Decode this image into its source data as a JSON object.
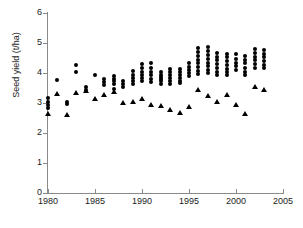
{
  "chart_data": {
    "type": "scatter",
    "title": "",
    "subtitle": "",
    "xlabel": "",
    "ylabel": "Seed yield (t/ha)",
    "xlim": [
      1980,
      2005
    ],
    "ylim": [
      0,
      6
    ],
    "xticks": [
      1980,
      1985,
      1990,
      1995,
      2000,
      2005
    ],
    "yticks": [
      0,
      1,
      2,
      3,
      4,
      5,
      6
    ],
    "xtick_labels": [
      "1980",
      "1985",
      "1990",
      "1995",
      "2000",
      "2005"
    ],
    "ytick_labels": [
      "0",
      "1",
      "2",
      "3",
      "4",
      "5",
      "6"
    ],
    "grid": false,
    "legend": "none",
    "marker_colors": {
      "circle": "#000000",
      "triangle": "#000000"
    },
    "series": [
      {
        "name": "Trial seed yield",
        "marker": "circle",
        "points": [
          [
            1980,
            3.18
          ],
          [
            1980,
            3.05
          ],
          [
            1980,
            2.95
          ],
          [
            1980,
            2.85
          ],
          [
            1981,
            3.77
          ],
          [
            1982,
            3.05
          ],
          [
            1982,
            2.98
          ],
          [
            1983,
            4.27
          ],
          [
            1983,
            4.03
          ],
          [
            1984,
            3.55
          ],
          [
            1984,
            3.45
          ],
          [
            1985,
            3.95
          ],
          [
            1986,
            3.8
          ],
          [
            1986,
            3.7
          ],
          [
            1986,
            3.6
          ],
          [
            1987,
            3.9
          ],
          [
            1987,
            3.8
          ],
          [
            1987,
            3.72
          ],
          [
            1987,
            3.62
          ],
          [
            1987,
            3.48
          ],
          [
            1988,
            3.72
          ],
          [
            1988,
            3.62
          ],
          [
            1988,
            3.55
          ],
          [
            1989,
            4.08
          ],
          [
            1989,
            3.95
          ],
          [
            1989,
            3.85
          ],
          [
            1989,
            3.75
          ],
          [
            1989,
            3.65
          ],
          [
            1990,
            4.3
          ],
          [
            1990,
            4.18
          ],
          [
            1990,
            4.05
          ],
          [
            1990,
            3.95
          ],
          [
            1990,
            3.85
          ],
          [
            1990,
            3.75
          ],
          [
            1991,
            4.32
          ],
          [
            1991,
            4.18
          ],
          [
            1991,
            4.05
          ],
          [
            1991,
            3.92
          ],
          [
            1991,
            3.8
          ],
          [
            1991,
            3.7
          ],
          [
            1992,
            4.05
          ],
          [
            1992,
            3.95
          ],
          [
            1992,
            3.88
          ],
          [
            1992,
            3.8
          ],
          [
            1992,
            3.72
          ],
          [
            1992,
            3.62
          ],
          [
            1993,
            4.12
          ],
          [
            1993,
            4.02
          ],
          [
            1993,
            3.92
          ],
          [
            1993,
            3.82
          ],
          [
            1993,
            3.72
          ],
          [
            1993,
            3.62
          ],
          [
            1994,
            4.15
          ],
          [
            1994,
            4.05
          ],
          [
            1994,
            3.95
          ],
          [
            1994,
            3.85
          ],
          [
            1994,
            3.75
          ],
          [
            1994,
            3.68
          ],
          [
            1995,
            4.32
          ],
          [
            1995,
            4.2
          ],
          [
            1995,
            4.1
          ],
          [
            1995,
            4.0
          ],
          [
            1995,
            3.9
          ],
          [
            1996,
            4.85
          ],
          [
            1996,
            4.7
          ],
          [
            1996,
            4.58
          ],
          [
            1996,
            4.45
          ],
          [
            1996,
            4.32
          ],
          [
            1996,
            4.2
          ],
          [
            1996,
            4.08
          ],
          [
            1996,
            3.98
          ],
          [
            1997,
            4.88
          ],
          [
            1997,
            4.72
          ],
          [
            1997,
            4.6
          ],
          [
            1997,
            4.48
          ],
          [
            1997,
            4.35
          ],
          [
            1997,
            4.22
          ],
          [
            1997,
            4.1
          ],
          [
            1997,
            4.0
          ],
          [
            1998,
            4.68
          ],
          [
            1998,
            4.55
          ],
          [
            1998,
            4.42
          ],
          [
            1998,
            4.3
          ],
          [
            1998,
            4.18
          ],
          [
            1998,
            4.05
          ],
          [
            1998,
            3.95
          ],
          [
            1999,
            4.65
          ],
          [
            1999,
            4.52
          ],
          [
            1999,
            4.4
          ],
          [
            1999,
            4.28
          ],
          [
            1999,
            4.15
          ],
          [
            1999,
            4.05
          ],
          [
            1999,
            3.92
          ],
          [
            2000,
            4.62
          ],
          [
            2000,
            4.48
          ],
          [
            2000,
            4.35
          ],
          [
            2000,
            4.22
          ],
          [
            2000,
            4.1
          ],
          [
            2001,
            4.58
          ],
          [
            2001,
            4.45
          ],
          [
            2001,
            4.32
          ],
          [
            2001,
            4.18
          ],
          [
            2001,
            4.05
          ],
          [
            2001,
            3.92
          ],
          [
            2002,
            4.8
          ],
          [
            2002,
            4.68
          ],
          [
            2002,
            4.55
          ],
          [
            2002,
            4.42
          ],
          [
            2002,
            4.3
          ],
          [
            2002,
            4.18
          ],
          [
            2003,
            4.78
          ],
          [
            2003,
            4.65
          ],
          [
            2003,
            4.52
          ],
          [
            2003,
            4.4
          ],
          [
            2003,
            4.28
          ],
          [
            2003,
            4.18
          ]
        ]
      },
      {
        "name": "District seed yield",
        "marker": "triangle",
        "points": [
          [
            1980,
            2.65
          ],
          [
            1981,
            3.3
          ],
          [
            1982,
            2.6
          ],
          [
            1983,
            3.35
          ],
          [
            1984,
            3.4
          ],
          [
            1985,
            3.12
          ],
          [
            1986,
            3.28
          ],
          [
            1987,
            3.38
          ],
          [
            1988,
            3.0
          ],
          [
            1989,
            3.02
          ],
          [
            1990,
            3.12
          ],
          [
            1991,
            2.92
          ],
          [
            1992,
            2.9
          ],
          [
            1993,
            2.78
          ],
          [
            1994,
            2.68
          ],
          [
            1995,
            2.88
          ],
          [
            1996,
            3.45
          ],
          [
            1997,
            3.25
          ],
          [
            1998,
            3.02
          ],
          [
            1999,
            3.28
          ],
          [
            2000,
            2.95
          ],
          [
            2001,
            2.62
          ],
          [
            2002,
            3.52
          ],
          [
            2003,
            3.42
          ]
        ]
      }
    ]
  }
}
